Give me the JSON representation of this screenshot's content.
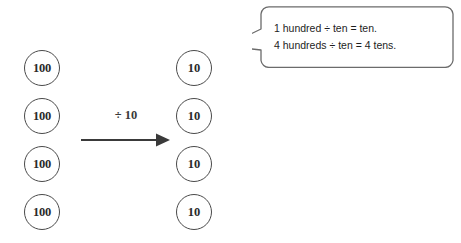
{
  "diagram": {
    "type": "place-value-disk-division",
    "background_color": "#ffffff",
    "disk_outline_color": "#4a4a4a",
    "text_color": "#1d1d1d",
    "left_column": {
      "label": "hundreds",
      "disks": [
        {
          "value": "100"
        },
        {
          "value": "100"
        },
        {
          "value": "100"
        },
        {
          "value": "100"
        }
      ]
    },
    "right_column": {
      "label": "tens",
      "disks": [
        {
          "value": "10"
        },
        {
          "value": "10"
        },
        {
          "value": "10"
        },
        {
          "value": "10"
        }
      ]
    },
    "operation": {
      "label": "÷ 10",
      "icon": "right-arrow-icon"
    },
    "callout": {
      "lines": [
        "1 hundred ÷ ten = ten.",
        "4 hundreds ÷ ten = 4 tens."
      ],
      "tail_points_to": "right-column-disk-1",
      "border_color": "#6b6b6b"
    }
  }
}
